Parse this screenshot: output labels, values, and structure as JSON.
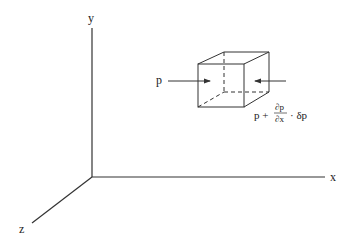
{
  "diagram": {
    "type": "3d-axes-with-fluid-element",
    "axes": {
      "x_label": "x",
      "y_label": "y",
      "z_label": "z"
    },
    "element": {
      "shape": "cube",
      "hidden_edges": "dashed"
    },
    "forces": {
      "left_label": "p",
      "right_label_base": "p +",
      "right_fraction_numerator": "∂p",
      "right_fraction_denominator": "∂x",
      "right_label_tail": "· δp"
    },
    "colors": {
      "line": "#333333",
      "background": "#ffffff"
    }
  }
}
